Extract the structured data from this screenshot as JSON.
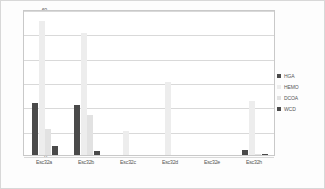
{
  "chart_data": {
    "type": "bar",
    "title": "",
    "subtitle": "",
    "xlabel": "",
    "ylabel": "",
    "ylim": [
      0,
      60
    ],
    "yticks": [
      0,
      10,
      20,
      30,
      40,
      50,
      60
    ],
    "ytick_labels": [
      "0",
      "10",
      "20",
      "30",
      "40",
      "50",
      "60"
    ],
    "grid": true,
    "legend_position": "right",
    "categories": [
      "Esc32a",
      "Esc32b",
      "Esc32c",
      "Esc32d",
      "Esc32e",
      "Esc32h"
    ],
    "series": [
      {
        "name": "HGA",
        "color": "#4a4a4a",
        "values": [
          21.5,
          20.5,
          0,
          0,
          0,
          2.0
        ]
      },
      {
        "name": "HEMO",
        "color": "#ededed",
        "values": [
          55.0,
          50.0,
          10.0,
          30.0,
          0,
          22.0
        ]
      },
      {
        "name": "DCOA",
        "color": "#e2e2e2",
        "values": [
          10.5,
          16.5,
          0,
          0,
          0,
          0.4
        ]
      },
      {
        "name": "WCD",
        "color": "#4a4a4a",
        "values": [
          3.5,
          1.8,
          0,
          0,
          0,
          0.3
        ]
      }
    ]
  },
  "figure": {
    "border_color": "#d8d8d8",
    "plot_background": "#ffffff",
    "gridline_color": "#d9d9d9"
  }
}
